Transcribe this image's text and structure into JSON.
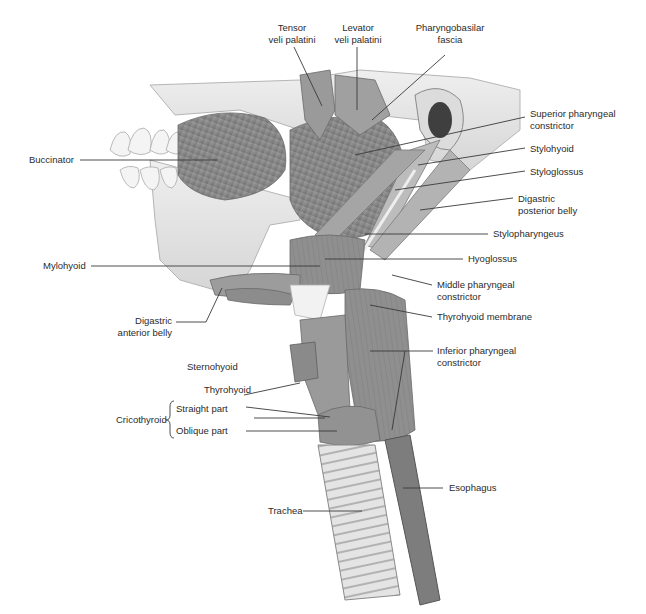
{
  "figure": {
    "colors": {
      "background": "#ffffff",
      "muscle": "#8e8e8e",
      "muscle_dark": "#6f6f6f",
      "bone": "#e6e6e6",
      "tendon": "#f2f2f2",
      "leader_line": "#3a3a3a",
      "label_text": "#2b2b2b"
    }
  },
  "labels": {
    "tensor_veli_palatini": {
      "line1": "Tensor",
      "line2": "veli palatini"
    },
    "levator_veli_palatini": {
      "line1": "Levator",
      "line2": "veli palatini"
    },
    "pharyngobasilar_fascia": {
      "line1": "Pharyngobasilar",
      "line2": "fascia"
    },
    "superior_pharyngeal_constrictor": {
      "line1": "Superior pharyngeal",
      "line2": "constrictor"
    },
    "stylohyoid": "Stylohyoid",
    "styloglossus": "Styloglossus",
    "digastric_posterior_belly": {
      "line1": "Digastric",
      "line2": "posterior belly"
    },
    "stylopharyngeus": "Stylopharyngeus",
    "hyoglossus": "Hyoglossus",
    "middle_pharyngeal_constrictor": {
      "line1": "Middle pharyngeal",
      "line2": "constrictor"
    },
    "thyrohyoid_membrane": "Thyrohyoid  membrane",
    "inferior_pharyngeal_constrictor": {
      "line1": "Inferior pharyngeal",
      "line2": "constrictor"
    },
    "esophagus": "Esophagus",
    "buccinator": "Buccinator",
    "mylohyoid": "Mylohyoid",
    "digastric_anterior_belly": {
      "line1": "Digastric",
      "line2": "anterior belly"
    },
    "sternohyoid": "Sternohyoid",
    "thyrohyoid": "Thyrohyoid",
    "cricothyroid": {
      "group": "Cricothyroid",
      "straight": "Straight part",
      "oblique": "Oblique part"
    },
    "trachea": "Trachea"
  }
}
